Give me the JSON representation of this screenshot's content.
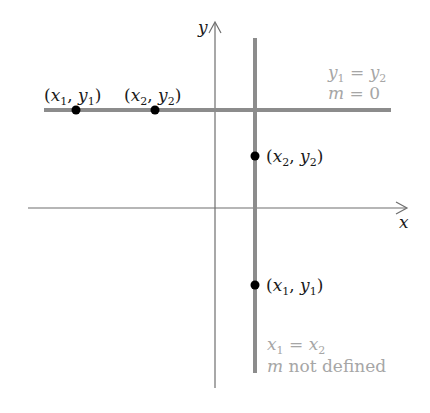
{
  "diagram": {
    "axes": {
      "x_label": "x",
      "y_label": "y",
      "color": "#6e6e6e"
    },
    "horizontal_line": {
      "color": "#8c8c8c",
      "annotation_line1": "y₁ = y₂",
      "annotation_line1_parts": [
        "y",
        "1",
        " = ",
        "y",
        "2"
      ],
      "annotation_line2_parts": [
        "m",
        " = 0"
      ],
      "points": [
        {
          "label_parts": [
            "(",
            "x",
            "1",
            ", ",
            "y",
            "1",
            ")"
          ]
        },
        {
          "label_parts": [
            "(",
            "x",
            "2",
            ", ",
            "y",
            "2",
            ")"
          ]
        }
      ]
    },
    "vertical_line": {
      "color": "#8c8c8c",
      "annotation_line1_parts": [
        "x",
        "1",
        " = ",
        "x",
        "2"
      ],
      "annotation_line2_parts": [
        "m",
        " not defined"
      ],
      "points": [
        {
          "label_parts": [
            "(",
            "x",
            "2",
            ", ",
            "y",
            "2",
            ")"
          ]
        },
        {
          "label_parts": [
            "(",
            "x",
            "1",
            ", ",
            "y",
            "1",
            ")"
          ]
        }
      ]
    },
    "label_color_dark": "#1a1a1a",
    "label_color_light": "#a6a6a6",
    "point_color": "#000000"
  }
}
